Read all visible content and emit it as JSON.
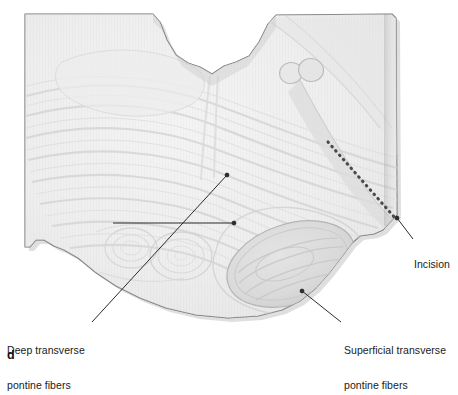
{
  "figure": {
    "panel_letter": "d",
    "background_color": "#ffffff",
    "specimen_fill_color": "#efefef",
    "specimen_outline_color": "#6f6f6f",
    "leader_line_color": "#2b2b2b",
    "incision_dash_color": "#4a4a4a",
    "text_color": "#1a1a1a"
  },
  "annotations": {
    "deep_fibers": {
      "line1": "Deep transverse",
      "line2": "pontine fibers",
      "full": "Deep transverse pontine fibers"
    },
    "superficial_fibers": {
      "line1": "Superficial transverse",
      "line2": "pontine fibers",
      "full": "Superficial transverse pontine fibers"
    },
    "incision": {
      "line1": "Incision",
      "full": "Incision"
    }
  },
  "structures": [
    {
      "name": "middle-cerebellar-peduncle-oval",
      "cx": 291,
      "cy": 264,
      "rx": 66,
      "ry": 40,
      "rotation": -18
    },
    {
      "name": "cranial-nerve-root-oval-left",
      "cx": 291,
      "cy": 73,
      "rx": 11,
      "ry": 10
    },
    {
      "name": "cranial-nerve-root-oval-right",
      "cx": 311,
      "cy": 70,
      "rx": 12,
      "ry": 11
    },
    {
      "name": "deep-fiber-whorl-left",
      "cx": 131,
      "cy": 248,
      "rx": 26,
      "ry": 20
    },
    {
      "name": "deep-fiber-whorl-center",
      "cx": 180,
      "cy": 255,
      "rx": 30,
      "ry": 24
    }
  ],
  "incision_line": {
    "name": "incision-dashed-line",
    "start": {
      "x": 328,
      "y": 142
    },
    "end": {
      "x": 396,
      "y": 219
    },
    "dot_count": 19
  },
  "leader_lines": [
    {
      "name": "leader-deep-diagonal",
      "from": {
        "x": 92,
        "y": 322
      },
      "to": {
        "x": 227,
        "y": 175
      }
    },
    {
      "name": "leader-deep-horizontal",
      "from": {
        "x": 113,
        "y": 223
      },
      "to": {
        "x": 234,
        "y": 223
      }
    },
    {
      "name": "leader-superficial",
      "from": {
        "x": 341,
        "y": 322
      },
      "to": {
        "x": 302,
        "y": 291
      }
    },
    {
      "name": "leader-incision",
      "from": {
        "x": 413,
        "y": 239
      },
      "to": {
        "x": 397,
        "y": 218
      }
    }
  ]
}
